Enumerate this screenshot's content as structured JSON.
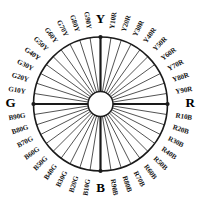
{
  "figure": {
    "name": "ncs-hue-circle",
    "background_color": "#ffffff",
    "line_color": "#1a1a1a",
    "text_color": "#141414",
    "hub_fill": "#ffffff"
  },
  "geometry": {
    "center_x": 100.5,
    "center_y": 104,
    "outer_radius": 67,
    "hub_radius": 12.5,
    "label_radius": 76,
    "cardinal_label_radius": 80,
    "spoke_count": 40,
    "sectors_per_quadrant": 10
  },
  "chart_data": {
    "type": "pie",
    "xlabel": "",
    "ylabel": "",
    "categories": [
      "Y",
      "Y10R",
      "Y20R",
      "Y30R",
      "Y40R",
      "Y50R",
      "Y60R",
      "Y70R",
      "Y80R",
      "Y90R",
      "R",
      "R10B",
      "R20B",
      "R30B",
      "R40B",
      "R50B",
      "R60B",
      "R70B",
      "R80B",
      "R90B",
      "B",
      "B10G",
      "B20G",
      "B30G",
      "B40G",
      "B50G",
      "B60G",
      "B70G",
      "B80G",
      "B90G",
      "G",
      "G10Y",
      "G20Y",
      "G30Y",
      "G40Y",
      "G50Y",
      "G60Y",
      "G70Y",
      "G80Y",
      "G90Y"
    ],
    "values": [
      9,
      9,
      9,
      9,
      9,
      9,
      9,
      9,
      9,
      9,
      9,
      9,
      9,
      9,
      9,
      9,
      9,
      9,
      9,
      9,
      9,
      9,
      9,
      9,
      9,
      9,
      9,
      9,
      9,
      9,
      9,
      9,
      9,
      9,
      9,
      9,
      9,
      9,
      9,
      9
    ],
    "angles_deg": [
      270,
      279,
      288,
      297,
      306,
      315,
      324,
      333,
      342,
      351,
      0,
      9,
      18,
      27,
      36,
      45,
      54,
      63,
      72,
      81,
      90,
      99,
      108,
      117,
      126,
      135,
      144,
      153,
      162,
      171,
      180,
      189,
      198,
      207,
      216,
      225,
      234,
      243,
      252,
      261
    ],
    "grid": false,
    "legend": "none"
  },
  "cardinals": [
    {
      "label": "Y",
      "angle_deg": 270,
      "position": "top"
    },
    {
      "label": "R",
      "angle_deg": 0,
      "position": "right"
    },
    {
      "label": "B",
      "angle_deg": 90,
      "position": "bottom"
    },
    {
      "label": "G",
      "angle_deg": 180,
      "position": "left"
    }
  ],
  "hues": [
    {
      "label": "Y10R",
      "angle_deg": 279
    },
    {
      "label": "Y20R",
      "angle_deg": 288
    },
    {
      "label": "Y30R",
      "angle_deg": 297
    },
    {
      "label": "Y40R",
      "angle_deg": 306
    },
    {
      "label": "Y50R",
      "angle_deg": 315
    },
    {
      "label": "Y60R",
      "angle_deg": 324
    },
    {
      "label": "Y70R",
      "angle_deg": 333
    },
    {
      "label": "Y80R",
      "angle_deg": 342
    },
    {
      "label": "Y90R",
      "angle_deg": 351
    },
    {
      "label": "R10B",
      "angle_deg": 9
    },
    {
      "label": "R20B",
      "angle_deg": 18
    },
    {
      "label": "R30B",
      "angle_deg": 27
    },
    {
      "label": "R40B",
      "angle_deg": 36
    },
    {
      "label": "R50B",
      "angle_deg": 45
    },
    {
      "label": "R60B",
      "angle_deg": 54
    },
    {
      "label": "R70B",
      "angle_deg": 63
    },
    {
      "label": "R80B",
      "angle_deg": 72
    },
    {
      "label": "R90B",
      "angle_deg": 81
    },
    {
      "label": "B10G",
      "angle_deg": 99
    },
    {
      "label": "B20G",
      "angle_deg": 108
    },
    {
      "label": "B30G",
      "angle_deg": 117
    },
    {
      "label": "B40G",
      "angle_deg": 126
    },
    {
      "label": "B50G",
      "angle_deg": 135
    },
    {
      "label": "B60G",
      "angle_deg": 144
    },
    {
      "label": "B70G",
      "angle_deg": 153
    },
    {
      "label": "B80G",
      "angle_deg": 162
    },
    {
      "label": "B90G",
      "angle_deg": 171
    },
    {
      "label": "G10Y",
      "angle_deg": 189
    },
    {
      "label": "G20Y",
      "angle_deg": 198
    },
    {
      "label": "G30Y",
      "angle_deg": 207
    },
    {
      "label": "G40Y",
      "angle_deg": 216
    },
    {
      "label": "G50Y",
      "angle_deg": 225
    },
    {
      "label": "G60Y",
      "angle_deg": 234
    },
    {
      "label": "G70Y",
      "angle_deg": 243
    },
    {
      "label": "G80Y",
      "angle_deg": 252
    },
    {
      "label": "G90Y",
      "angle_deg": 261
    }
  ]
}
